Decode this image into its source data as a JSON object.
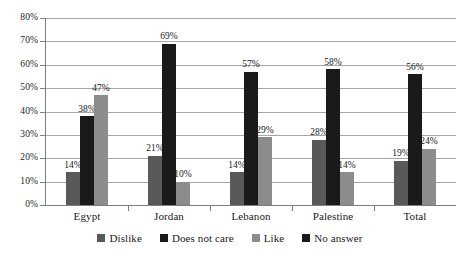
{
  "chart_data": {
    "type": "bar",
    "title": "",
    "subtitle": "",
    "xlabel": "",
    "ylabel": "",
    "ylim": [
      0,
      80
    ],
    "ytick_labels": [
      "0%",
      "10%",
      "20%",
      "30%",
      "40%",
      "50%",
      "60%",
      "70%",
      "80%"
    ],
    "ytick_values": [
      0,
      10,
      20,
      30,
      40,
      50,
      60,
      70,
      80
    ],
    "grid": "horizontal",
    "legend_position": "bottom",
    "categories": [
      "Egypt",
      "Jordan",
      "Lebanon",
      "Palestine",
      "Total"
    ],
    "series": [
      {
        "name": "Dislike",
        "color": "#595959",
        "values": [
          14,
          21,
          14,
          28,
          19
        ],
        "labels": [
          "14%",
          "21%",
          "14%",
          "28%",
          "19%"
        ]
      },
      {
        "name": "Does not care",
        "color": "#1a1a1a",
        "values": [
          38,
          69,
          57,
          58,
          56
        ],
        "labels": [
          "38%",
          "69%",
          "57%",
          "58%",
          "56%"
        ]
      },
      {
        "name": "Like",
        "color": "#8c8c8c",
        "values": [
          47,
          10,
          29,
          14,
          24
        ],
        "labels": [
          "47%",
          "10%",
          "29%",
          "14%",
          "24%"
        ]
      },
      {
        "name": "No answer",
        "color": "#1a1a1a",
        "values": [
          0,
          0,
          0,
          0,
          0
        ],
        "labels": [
          "",
          "",
          "",
          "",
          ""
        ]
      }
    ]
  },
  "legend": {
    "items": [
      {
        "label": "Dislike",
        "color": "#595959"
      },
      {
        "label": "Does not care",
        "color": "#1a1a1a"
      },
      {
        "label": "Like",
        "color": "#8c8c8c"
      },
      {
        "label": "No answer",
        "color": "#1a1a1a"
      }
    ]
  }
}
